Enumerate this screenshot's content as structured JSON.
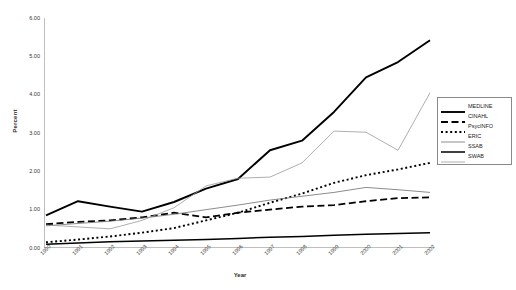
{
  "chart_data": {
    "type": "line",
    "title": "",
    "xlabel": "Year",
    "ylabel": "Percent",
    "grid": false,
    "legend_position": "right",
    "xlim": [
      1990,
      2002
    ],
    "ylim": [
      0.0,
      6.0
    ],
    "ytick_labels": [
      "0.00",
      "1.00",
      "2.00",
      "3.00",
      "4.00",
      "5.00",
      "6.00"
    ],
    "ytick_values": [
      0,
      1,
      2,
      3,
      4,
      5,
      6
    ],
    "categories": [
      "1990",
      "1991",
      "1992",
      "1993",
      "1994",
      "1995",
      "1996",
      "1997",
      "1998",
      "1999",
      "2000",
      "2001",
      "2002"
    ],
    "series": [
      {
        "name": "MEDLINE",
        "style": "solid-thick",
        "color": "#000000",
        "values": [
          0.85,
          1.22,
          1.08,
          0.95,
          1.2,
          1.55,
          1.8,
          2.55,
          2.8,
          3.55,
          4.45,
          4.85,
          5.42
        ]
      },
      {
        "name": "CINAHL",
        "style": "dashed",
        "color": "#000000",
        "values": [
          0.62,
          0.68,
          0.72,
          0.8,
          0.92,
          0.8,
          0.92,
          1.0,
          1.08,
          1.12,
          1.22,
          1.3,
          1.32
        ]
      },
      {
        "name": "PsycINFO",
        "style": "dotted",
        "color": "#000000",
        "values": [
          0.15,
          0.22,
          0.3,
          0.4,
          0.52,
          0.72,
          0.92,
          1.18,
          1.42,
          1.7,
          1.9,
          2.05,
          2.22
        ]
      },
      {
        "name": "ERIC",
        "style": "solid-thin",
        "color": "#6e6e6e",
        "values": [
          0.58,
          0.64,
          0.7,
          0.78,
          0.88,
          1.0,
          1.12,
          1.25,
          1.35,
          1.45,
          1.58,
          1.52,
          1.45
        ]
      },
      {
        "name": "SSAB",
        "style": "solid-medium",
        "color": "#000000",
        "values": [
          0.1,
          0.13,
          0.16,
          0.18,
          0.2,
          0.22,
          0.25,
          0.28,
          0.3,
          0.33,
          0.36,
          0.38,
          0.4
        ]
      },
      {
        "name": "SWAB",
        "style": "solid-light",
        "color": "#9a9a9a",
        "values": [
          0.6,
          0.55,
          0.5,
          0.72,
          1.05,
          1.62,
          1.82,
          1.85,
          2.22,
          3.05,
          3.02,
          2.55,
          4.05
        ]
      }
    ]
  },
  "legend": {
    "items": [
      {
        "label": "MEDLINE"
      },
      {
        "label": "CINAHL"
      },
      {
        "label": "PsycINFO"
      },
      {
        "label": "ERIC"
      },
      {
        "label": "SSAB"
      },
      {
        "label": "SWAB"
      }
    ]
  }
}
